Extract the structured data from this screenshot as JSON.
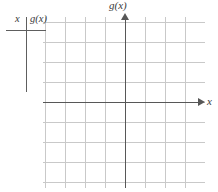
{
  "figure": {
    "type": "coordinate-grid-with-table",
    "background_color": "#ffffff",
    "axis_color": "#575757",
    "grid_major_color": "#c9c9c9",
    "grid_minor_color": "#e8e8e8",
    "text_color": "#3a3a3a"
  },
  "table": {
    "name": "function-value-table",
    "columns": [
      {
        "header": "x"
      },
      {
        "header": "g(x)"
      }
    ],
    "rows": []
  },
  "axes": {
    "x_label": "x",
    "y_label": "g(x)",
    "x_arrow": "arrow-right",
    "y_arrow": "arrow-up"
  },
  "chart_data": {
    "type": "scatter",
    "title": "",
    "xlabel": "x",
    "ylabel": "g(x)",
    "x": [],
    "values": [],
    "series": [],
    "grid": true,
    "legend": "none",
    "xlim": [
      -8,
      8
    ],
    "ylim": [
      -17,
      17
    ],
    "minor_grid_step": 1,
    "major_grid_step": 4,
    "tick_labels_shown": false,
    "annotations": []
  }
}
